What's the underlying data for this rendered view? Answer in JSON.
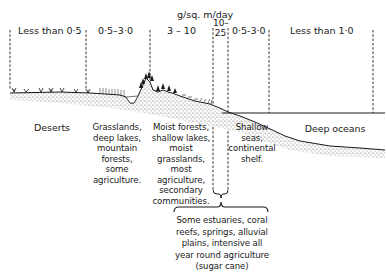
{
  "diagram": {
    "unit_title": "g/sq. m/day",
    "ranges": [
      {
        "id": "deserts",
        "label": "Less than 0·5"
      },
      {
        "id": "grasslands",
        "label": "0·5–3·0"
      },
      {
        "id": "moist-forests",
        "label": "3 – 10"
      },
      {
        "id": "estuaries",
        "label": "10–\n25"
      },
      {
        "id": "shallow-seas",
        "label": "0·5-3·0"
      },
      {
        "id": "deep-oceans",
        "label": "Less than 1·0"
      }
    ],
    "zones": [
      {
        "id": "deserts",
        "label": "Deserts"
      },
      {
        "id": "grasslands",
        "label": "Grasslands,\ndeep lakes,\nmountain forests,\nsome agriculture."
      },
      {
        "id": "moist-forests",
        "label": "Moist forests,\nshallow lakes,\nmoist\ngrasslands,\nmost\nagriculture,\nsecondary\ncommunities."
      },
      {
        "id": "shallow-seas",
        "label": "Shallow\nseas,\ncontinental\nshelf."
      },
      {
        "id": "deep-oceans",
        "label": "Deep oceans"
      }
    ],
    "bracket_note": "Some estuaries, coral\nreefs, springs, alluvial\nplains, intensive all\nyear round agriculture\n(sugar cane)",
    "colors": {
      "ink": "#1a1a1a",
      "background": "#ffffff",
      "stipple": "#6b6b6b"
    }
  }
}
